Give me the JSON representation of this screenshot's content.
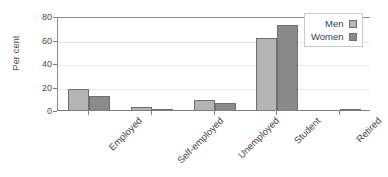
{
  "chart_data": {
    "type": "bar",
    "title": "",
    "xlabel": "",
    "ylabel": "Per cent",
    "ylim": [
      0,
      80
    ],
    "yticks": [
      0,
      20,
      40,
      60,
      80
    ],
    "grid": true,
    "legend_position": "top-right",
    "categories": [
      "Employed",
      "Self-employed",
      "Unemployed",
      "Student",
      "Retired"
    ],
    "series": [
      {
        "name": "Men",
        "color": "#b4b4b4",
        "values": [
          19,
          3,
          9,
          62,
          0
        ]
      },
      {
        "name": "Women",
        "color": "#8a8a8a",
        "values": [
          12.5,
          1.5,
          6.5,
          73,
          0.8
        ]
      }
    ]
  },
  "axis": {
    "y_title": "Per cent",
    "tick_labels": [
      "0",
      "20",
      "40",
      "60",
      "80"
    ]
  },
  "legend": {
    "entries": [
      {
        "label": "Men",
        "color": "#b4b4b4"
      },
      {
        "label": "Women",
        "color": "#8a8a8a"
      }
    ]
  },
  "colors": {
    "men": "#b4b4b4",
    "women": "#8a8a8a",
    "axis": "#7e7e7e",
    "grid": "#e8e8e8",
    "bar_border": "#6f6f6f",
    "text": "#4a4a4a",
    "background": "#ffffff"
  }
}
